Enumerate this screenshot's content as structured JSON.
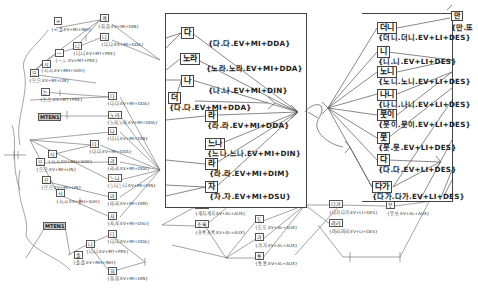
{
  "left_graph": {
    "nodes": [
      {
        "id": "n1",
        "label": "=",
        "x": 54,
        "y": 23
      },
      {
        "id": "n2",
        "label": "계",
        "x": 100,
        "y": 15
      },
      {
        "id": "n3",
        "label": "니",
        "x": 73,
        "y": 44
      },
      {
        "id": "n4",
        "label": "니",
        "x": 100,
        "y": 34
      },
      {
        "id": "n5",
        "label": "ㅡ",
        "x": 54,
        "y": 50
      },
      {
        "id": "n6",
        "label": "시",
        "x": 41,
        "y": 60
      },
      {
        "id": "n7",
        "label": "으",
        "x": 30,
        "y": 70
      },
      {
        "id": "n8",
        "label": "는",
        "x": 41,
        "y": 88
      },
      {
        "id": "n9",
        "label": "다",
        "x": 108,
        "y": 93
      },
      {
        "id": "n10",
        "label": "MTEN1",
        "x": 38,
        "y": 113,
        "shaded": true
      },
      {
        "id": "n11",
        "label": "노라",
        "x": 108,
        "y": 112
      },
      {
        "id": "n12",
        "label": "나",
        "x": 108,
        "y": 128
      },
      {
        "id": "n13",
        "label": "다",
        "x": 90,
        "y": 141
      },
      {
        "id": "n14",
        "label": "시",
        "x": 48,
        "y": 151
      },
      {
        "id": "n15",
        "label": "으",
        "x": 36,
        "y": 159
      },
      {
        "id": "n16",
        "label": "라",
        "x": 108,
        "y": 158
      },
      {
        "id": "n17",
        "label": "으",
        "x": 42,
        "y": 177
      },
      {
        "id": "n18",
        "label": "느나",
        "x": 108,
        "y": 175
      },
      {
        "id": "n19",
        "label": "시",
        "x": 56,
        "y": 190
      },
      {
        "id": "n20",
        "label": "라",
        "x": 108,
        "y": 193
      },
      {
        "id": "n21",
        "label": "자",
        "x": 108,
        "y": 213
      },
      {
        "id": "n22",
        "label": "MTEN1",
        "x": 43,
        "y": 222,
        "shaded": true
      },
      {
        "id": "n23",
        "label": "니",
        "x": 86,
        "y": 240
      },
      {
        "id": "n24",
        "label": "다",
        "x": 108,
        "y": 231
      },
      {
        "id": "n25",
        "label": "솔",
        "x": 74,
        "y": 252
      },
      {
        "id": "n26",
        "label": "휘",
        "x": 108,
        "y": 268
      }
    ],
    "labels": [
      {
        "text": "{=,솔.EV+MI+INH}",
        "x": 52,
        "y": 32
      },
      {
        "text": "{휘,휘.EV+MI+DIN}",
        "x": 98,
        "y": 25
      },
      {
        "text": "{니,니.EV+MT+PRE}",
        "x": 73,
        "y": 52
      },
      {
        "text": "{다,다.EV+MI+DDA}",
        "x": 101,
        "y": 43
      },
      {
        "text": "{ㅡ,ㄴ.EV+MT+PRE}",
        "x": 55,
        "y": 58
      },
      {
        "text": "{시,시.EV+MH+SUH}",
        "x": 41,
        "y": 68
      },
      {
        "text": "{으,으.EV+MI+LIN}",
        "x": 29,
        "y": 78
      },
      {
        "text": "{는,는.EV+MT+PRE}",
        "x": 40,
        "y": 97
      },
      {
        "text": "{다,다.EV+MI+DDA}",
        "x": 107,
        "y": 101
      },
      {
        "text": "{노라,노라.EV+MI+DDA}",
        "x": 107,
        "y": 120
      },
      {
        "text": "{나,나.EV+MI+DIN}",
        "x": 107,
        "y": 136
      },
      {
        "text": "{다,다.EV+MI+DDA}",
        "x": 89,
        "y": 149
      },
      {
        "text": "{시,시.EV+MH+SUH}",
        "x": 48,
        "y": 159
      },
      {
        "text": "{으,으.EV+MI+LIN}",
        "x": 36,
        "y": 167
      },
      {
        "text": "{라,라.EV+MI+DDA}",
        "x": 107,
        "y": 166
      },
      {
        "text": "{으,으.EV+MI+LIN}",
        "x": 41,
        "y": 185
      },
      {
        "text": "{느나,느나.EV+MI+DIN}",
        "x": 107,
        "y": 183
      },
      {
        "text": "{시,시.EV+MH+SUH}",
        "x": 56,
        "y": 199
      },
      {
        "text": "{라,라.EV+MI+DIM}",
        "x": 107,
        "y": 201
      },
      {
        "text": "{자,자.EV+MI+DSU}",
        "x": 107,
        "y": 221
      },
      {
        "text": "{다,다.EV+MI+DDA}",
        "x": 107,
        "y": 239
      },
      {
        "text": "{니,니.EV+MT+PRE}",
        "x": 86,
        "y": 249
      },
      {
        "text": "{솔,솔.EV+MH+INH}",
        "x": 73,
        "y": 260
      },
      {
        "text": "{휘,휘.EV+MI+DIN}",
        "x": 107,
        "y": 276
      }
    ]
  },
  "center_zoom": {
    "nodes": [
      {
        "label": "다",
        "x": 181,
        "y": 30
      },
      {
        "label": "노라",
        "x": 180,
        "y": 55
      },
      {
        "label": "나",
        "x": 181,
        "y": 77
      },
      {
        "label": "더",
        "x": 168,
        "y": 94
      },
      {
        "label": "라",
        "x": 205,
        "y": 112
      },
      {
        "label": "느나",
        "x": 205,
        "y": 140
      },
      {
        "label": "라",
        "x": 205,
        "y": 160
      },
      {
        "label": "자",
        "x": 205,
        "y": 183
      }
    ],
    "labels": [
      {
        "text": "{다.다.EV+MI+DDA}",
        "x": 208,
        "y": 40
      },
      {
        "text": "{노라.노라.EV+MI+DDA}",
        "x": 206,
        "y": 65
      },
      {
        "text": "{나.나.EV+MI+DIN}",
        "x": 208,
        "y": 87
      },
      {
        "text": "{다.다.EV+MI+DDA}",
        "x": 169,
        "y": 104
      },
      {
        "text": "{라.라.EV+MI+DDA}",
        "x": 207,
        "y": 122
      },
      {
        "text": "{느나.느나.EV+MI+DIN}",
        "x": 207,
        "y": 150
      },
      {
        "text": "{라.라.EV+MI+DIM}",
        "x": 209,
        "y": 170
      },
      {
        "text": "{자.자.EV+MI+DSU}",
        "x": 209,
        "y": 193
      }
    ]
  },
  "right_zoom": {
    "nodes": [
      {
        "label": "더니",
        "x": 377,
        "y": 24
      },
      {
        "label": "니",
        "x": 377,
        "y": 48
      },
      {
        "label": "노니",
        "x": 377,
        "y": 68
      },
      {
        "label": "나니",
        "x": 377,
        "y": 91
      },
      {
        "label": "뭇이",
        "x": 377,
        "y": 111
      },
      {
        "label": "뭇",
        "x": 377,
        "y": 134
      },
      {
        "label": "다",
        "x": 377,
        "y": 156
      },
      {
        "label": "다가",
        "x": 372,
        "y": 183
      },
      {
        "label": "만",
        "x": 451,
        "y": 14
      }
    ],
    "labels": [
      {
        "text": "{더니.더니.EV+LI+DES}",
        "x": 378,
        "y": 34
      },
      {
        "text": "{니.니.EV+LI+DES}",
        "x": 378,
        "y": 58
      },
      {
        "text": "{노니.노니.EV+LI+DES}",
        "x": 378,
        "y": 78
      },
      {
        "text": "{나니.나니.EV+LI+DES}",
        "x": 378,
        "y": 101
      },
      {
        "text": "{뭇이.뭇이.EV+LI+DES}",
        "x": 378,
        "y": 121
      },
      {
        "text": "{뭇.뭇.EV+LI+DES}",
        "x": 378,
        "y": 144
      },
      {
        "text": "{다.다.EV+LI+DES}",
        "x": 378,
        "y": 166
      },
      {
        "text": "{다가.다가.EV+LI+DES}",
        "x": 372,
        "y": 193
      },
      {
        "text": "{만.또",
        "x": 451,
        "y": 24
      }
    ]
  },
  "bottom_graph": {
    "nodes": [
      {
        "label": "게지",
        "x": 195,
        "y": 203
      },
      {
        "label": "조록",
        "x": 195,
        "y": 222
      },
      {
        "label": "도",
        "x": 255,
        "y": 217
      },
      {
        "label": "가",
        "x": 255,
        "y": 235
      },
      {
        "label": "통",
        "x": 255,
        "y": 254
      },
      {
        "label": "다가",
        "x": 329,
        "y": 202
      },
      {
        "label": "뭇",
        "x": 386,
        "y": 203
      },
      {
        "label": "려러",
        "x": 329,
        "y": 221
      }
    ],
    "labels": [
      {
        "text": "{게지.게지.EV+AL+AUX}",
        "x": 195,
        "y": 213
      },
      {
        "text": "{조록.조록.EV+AL+AUX}",
        "x": 195,
        "y": 232
      },
      {
        "text": "{도.도.EV+AL+AUX}",
        "x": 255,
        "y": 227
      },
      {
        "text": "{가.가.EV+AL+AUX}",
        "x": 255,
        "y": 245
      },
      {
        "text": "{통.통.EV+AL+AUX}",
        "x": 255,
        "y": 263
      },
      {
        "text": "{다가.다가.EV+LI+DES}",
        "x": 329,
        "y": 212
      },
      {
        "text": "{뭇.또.EV+AL+AUX}",
        "x": 387,
        "y": 213
      },
      {
        "text": "{려러.려러.EV+LI+DES}",
        "x": 329,
        "y": 231
      }
    ]
  }
}
